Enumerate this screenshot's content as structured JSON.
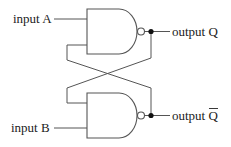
{
  "inputs": {
    "a": "input A",
    "b": "input B"
  },
  "outputs": {
    "q": "output Q",
    "q_bar_prefix": "output ",
    "q_bar_letter": "Q"
  },
  "components": {
    "gates": [
      "NAND (top)",
      "NAND (bottom)"
    ],
    "junctions": 2,
    "inversion_bubbles": 2
  },
  "colors": {
    "line": "#555555",
    "text": "#222222",
    "background": "#ffffff"
  }
}
